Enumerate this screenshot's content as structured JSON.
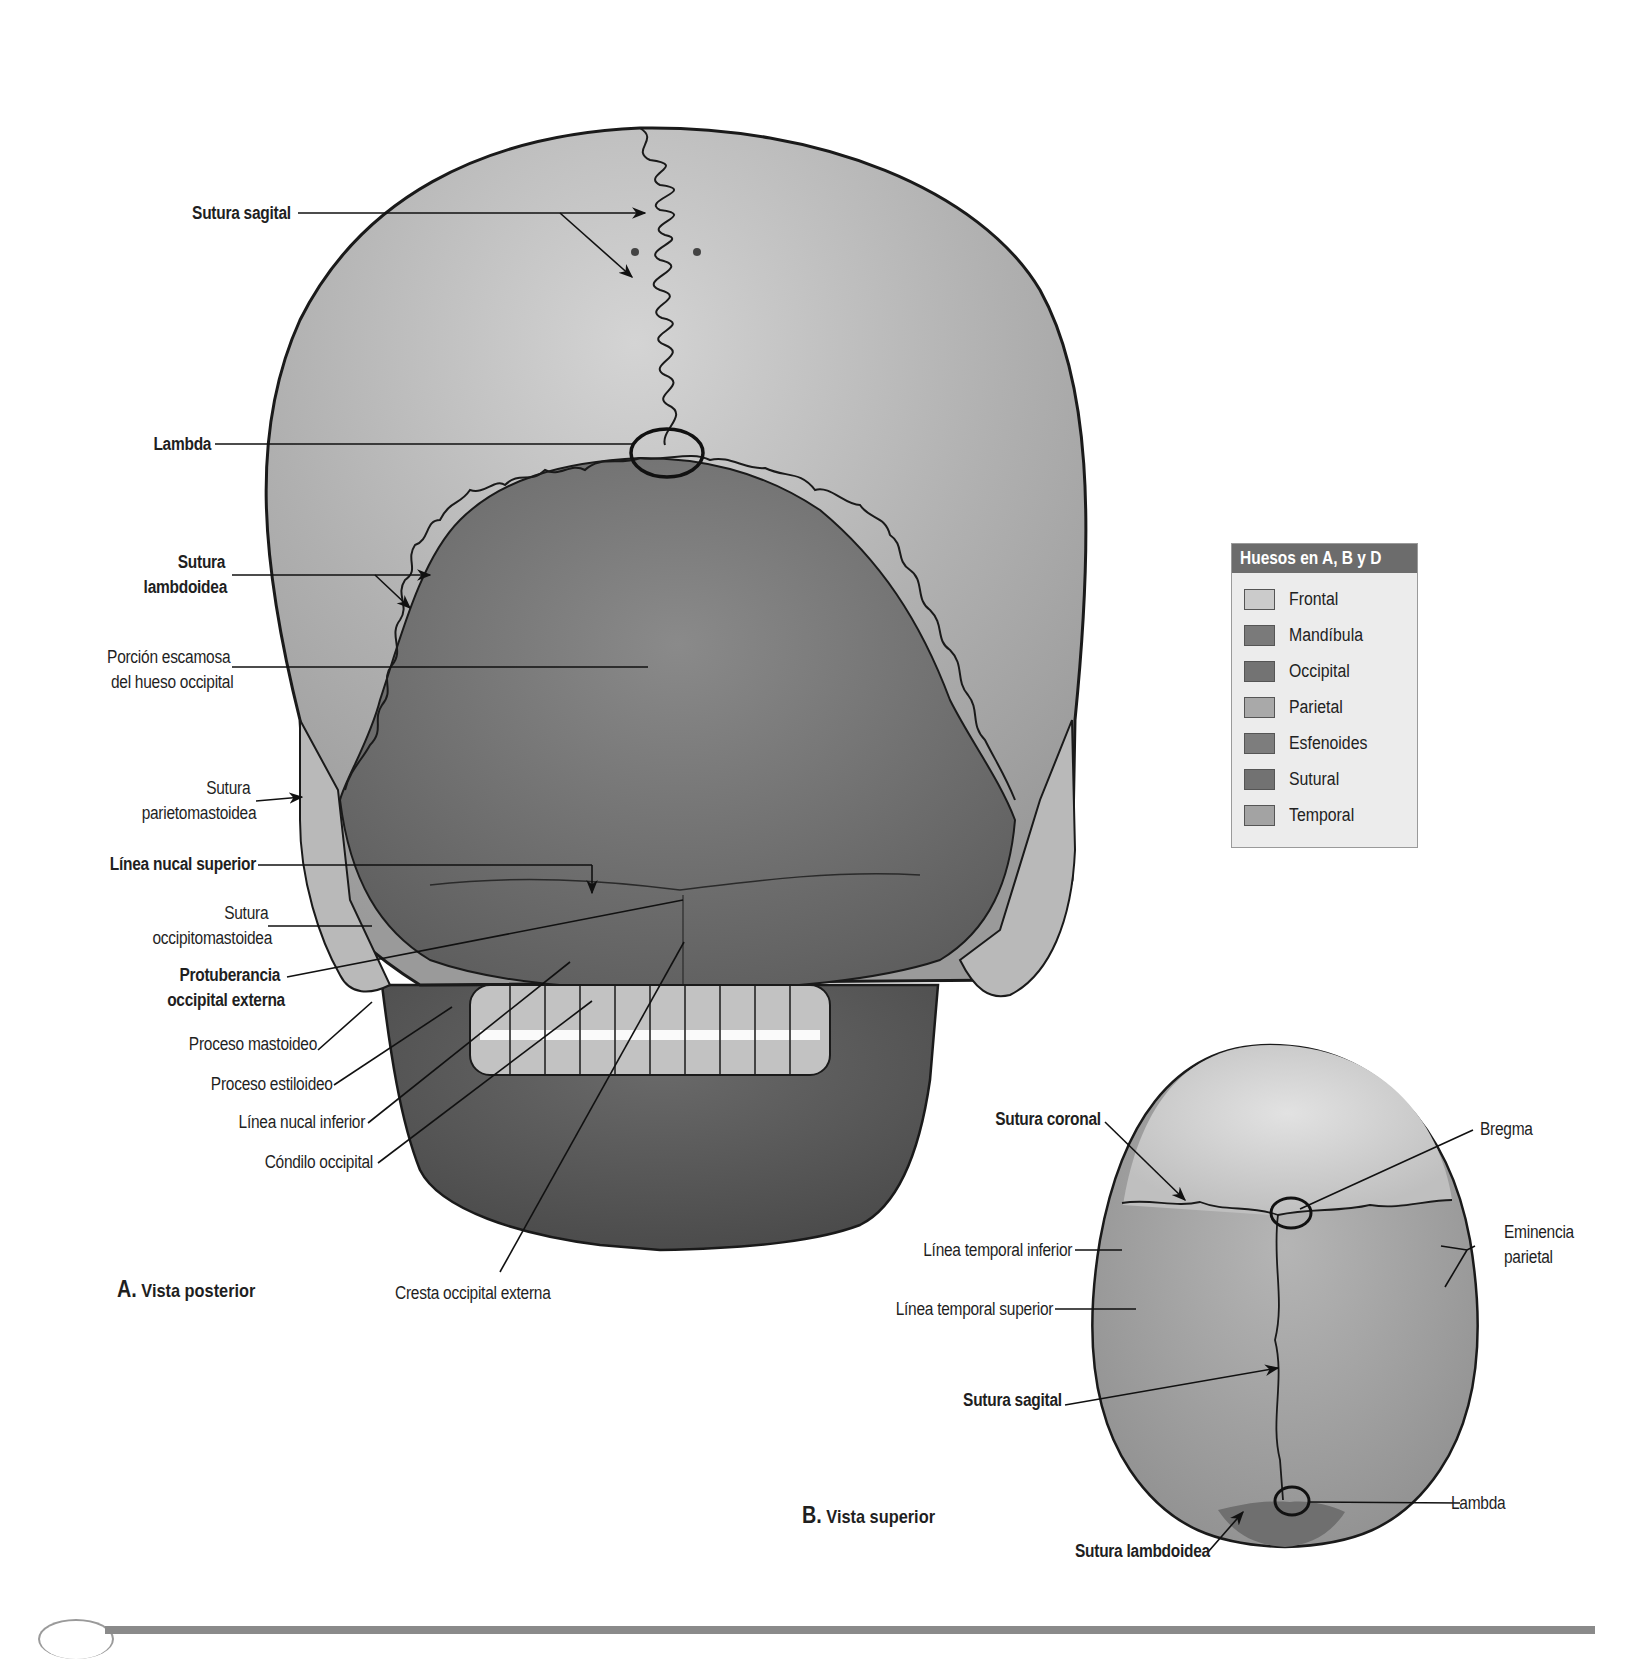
{
  "figure": {
    "views": {
      "posterior": {
        "letter": "A.",
        "title": "Vista posterior"
      },
      "superior": {
        "letter": "B.",
        "title": "Vista superior"
      }
    },
    "posterior_labels": [
      {
        "id": "sutura-sagital",
        "text": "Sutura sagital",
        "bold": true
      },
      {
        "id": "lambda",
        "text": "Lambda",
        "bold": true
      },
      {
        "id": "sutura-lambdoidea-1",
        "text": "Sutura",
        "bold": true
      },
      {
        "id": "sutura-lambdoidea-2",
        "text": "lambdoidea",
        "bold": true
      },
      {
        "id": "porcion-escamosa-1",
        "text": "Porción escamosa",
        "bold": false
      },
      {
        "id": "porcion-escamosa-2",
        "text": "del hueso occipital",
        "bold": false
      },
      {
        "id": "sutura-parietomastoidea-1",
        "text": "Sutura",
        "bold": false
      },
      {
        "id": "sutura-parietomastoidea-2",
        "text": "parietomastoidea",
        "bold": false
      },
      {
        "id": "linea-nucal-superior",
        "text": "Línea nucal superior",
        "bold": true
      },
      {
        "id": "sutura-occipitomastoidea-1",
        "text": "Sutura",
        "bold": false
      },
      {
        "id": "sutura-occipitomastoidea-2",
        "text": "occipitomastoidea",
        "bold": false
      },
      {
        "id": "protuberancia-1",
        "text": "Protuberancia",
        "bold": true
      },
      {
        "id": "protuberancia-2",
        "text": "occipital externa",
        "bold": true
      },
      {
        "id": "proceso-mastoideo",
        "text": "Proceso mastoideo",
        "bold": false
      },
      {
        "id": "proceso-estiloideo",
        "text": "Proceso estiloideo",
        "bold": false
      },
      {
        "id": "linea-nucal-inferior",
        "text": "Línea nucal inferior",
        "bold": false
      },
      {
        "id": "condilo-occipital",
        "text": "Cóndilo occipital",
        "bold": false
      },
      {
        "id": "cresta-occipital-externa",
        "text": "Cresta occipital externa",
        "bold": false
      }
    ],
    "superior_labels": [
      {
        "id": "sutura-coronal",
        "text": "Sutura coronal",
        "bold": true
      },
      {
        "id": "bregma",
        "text": "Bregma",
        "bold": false
      },
      {
        "id": "eminencia-parietal-1",
        "text": "Eminencia",
        "bold": false
      },
      {
        "id": "eminencia-parietal-2",
        "text": "parietal",
        "bold": false
      },
      {
        "id": "linea-temporal-inferior",
        "text": "Línea temporal inferior",
        "bold": false
      },
      {
        "id": "linea-temporal-superior",
        "text": "Línea temporal superior",
        "bold": false
      },
      {
        "id": "sutura-sagital-b",
        "text": "Sutura sagital",
        "bold": true
      },
      {
        "id": "lambda-b",
        "text": "Lambda",
        "bold": false
      },
      {
        "id": "sutura-lambdoidea-b",
        "text": "Sutura lambdoidea",
        "bold": true
      }
    ],
    "legend": {
      "title": "Huesos en A, B y D",
      "items": [
        {
          "label": "Frontal",
          "color": "#cbcbcb"
        },
        {
          "label": "Mandíbula",
          "color": "#7a7a7a"
        },
        {
          "label": "Occipital",
          "color": "#737373"
        },
        {
          "label": "Parietal",
          "color": "#a9a9a9"
        },
        {
          "label": "Esfenoides",
          "color": "#7d7d7d"
        },
        {
          "label": "Sutural",
          "color": "#727272"
        },
        {
          "label": "Temporal",
          "color": "#a3a3a3"
        }
      ]
    },
    "colors": {
      "frontal": "#cbcbcb",
      "parietal": "#a9a9a9",
      "occipital": "#6f6f6f",
      "mandible": "#5a5a5a",
      "temporal": "#b4b4b4",
      "teeth": "#bdbdbd",
      "outline": "#1a1a1a",
      "legend_header": "#6c6c6c",
      "footer_bar": "#8a8a8a"
    }
  }
}
